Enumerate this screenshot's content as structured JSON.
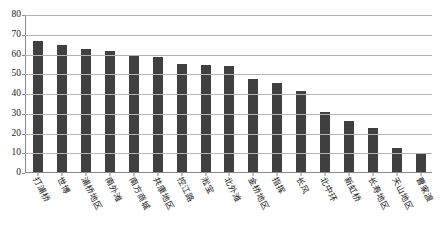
{
  "chart_data": {
    "type": "bar",
    "title": "",
    "xlabel": "",
    "ylabel": "",
    "ylim": [
      0,
      80
    ],
    "yticks": [
      0,
      10,
      20,
      30,
      40,
      50,
      60,
      70,
      80
    ],
    "grid": true,
    "legend": "none",
    "bar_color": "#404040",
    "axis_color": "#8a8a8a",
    "grid_color": "#b4b4b4",
    "categories": [
      "打浦桥",
      "世博",
      "浦桥地区",
      "南外滩",
      "南方商城",
      "共康地区",
      "控江路",
      "淞宝",
      "北外滩",
      "金桥地区",
      "指挥",
      "长风",
      "北中环",
      "新虹桥",
      "长寿地区",
      "天山地区",
      "曹家渡"
    ],
    "values": [
      66.5,
      64.5,
      62.5,
      61.5,
      59.5,
      58,
      54.5,
      54,
      53.5,
      47,
      45,
      41,
      30.5,
      26,
      22.5,
      12,
      9.5
    ]
  }
}
